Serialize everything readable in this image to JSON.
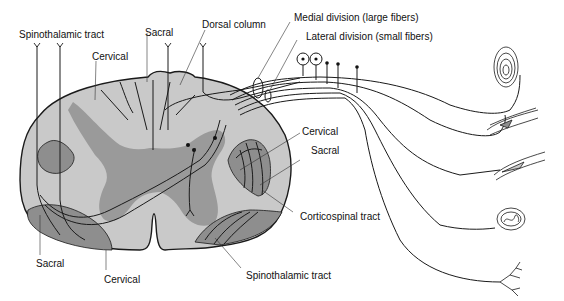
{
  "figure": {
    "colors": {
      "white_matter": "#c9c9c9",
      "gray_matter": "#9a9a9a",
      "tract": "#8e8e8e",
      "outline": "#1a1a1a",
      "background": "#ffffff"
    },
    "labels": {
      "spinothalamic_top": "Spinothalamic tract",
      "sacral_top": "Sacral",
      "dorsal_column": "Dorsal column",
      "cervical_top": "Cervical",
      "medial_division": "Medial division (large fibers)",
      "lateral_division": "Lateral division (small fibers)",
      "cervical_right": "Cervical",
      "sacral_right": "Sacral",
      "corticospinal": "Corticospinal tract",
      "sacral_bottom": "Sacral",
      "cervical_bottom": "Cervical",
      "spinothalamic_bottom": "Spinothalamic tract"
    },
    "receptors": [
      {
        "name": "pacinian-corpuscle"
      },
      {
        "name": "muscle-spindle"
      },
      {
        "name": "golgi-tendon-organ"
      },
      {
        "name": "meissner-corpuscle"
      },
      {
        "name": "free-nerve-ending"
      }
    ]
  }
}
